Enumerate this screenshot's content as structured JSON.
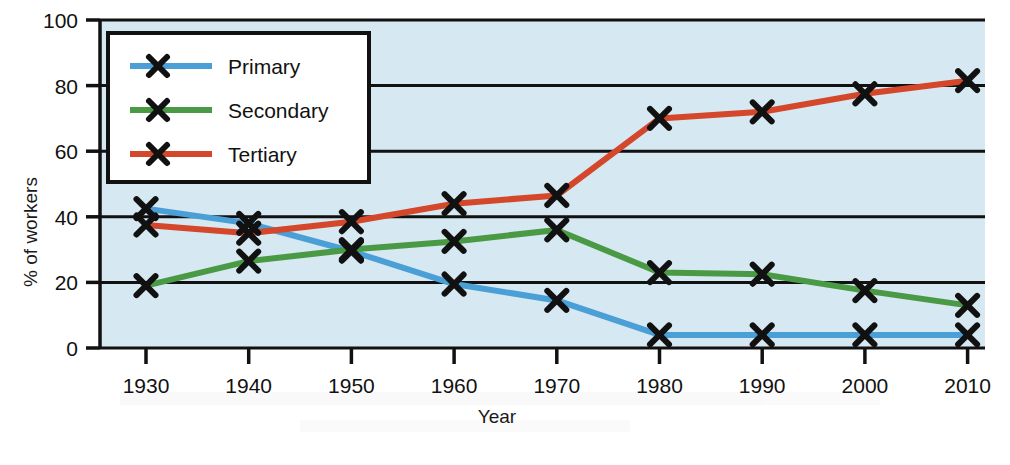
{
  "chart_data": {
    "type": "line",
    "title": "",
    "xlabel": "Year",
    "ylabel": "% of workers",
    "x": [
      1930,
      1940,
      1950,
      1960,
      1970,
      1980,
      1990,
      2000,
      2010
    ],
    "xticklabels": [
      "1930",
      "1940",
      "1950",
      "1960",
      "1970",
      "1980",
      "1990",
      "2000",
      "2010"
    ],
    "yticklabels": [
      "0",
      "20",
      "40",
      "60",
      "80",
      "100"
    ],
    "yticks": [
      0,
      20,
      40,
      60,
      80,
      100
    ],
    "xlim": [
      1925,
      1912
    ],
    "ylim": [
      0,
      100
    ],
    "grid": "horizontal",
    "legend_position": "upper-left-inside",
    "marker": "x",
    "marker_color": "#111111",
    "plot_background": "#d6e8f2",
    "series": [
      {
        "name": "Primary",
        "color": "#4a9fd6",
        "values": [
          42.5,
          38.0,
          29.5,
          19.5,
          14.5,
          4.0,
          4.0,
          4.0,
          4.0
        ]
      },
      {
        "name": "Secondary",
        "color": "#4a9a45",
        "values": [
          19.0,
          26.5,
          30.0,
          32.5,
          36.0,
          23.0,
          22.5,
          17.5,
          13.0
        ]
      },
      {
        "name": "Tertiary",
        "color": "#d4472a",
        "values": [
          37.5,
          35.0,
          38.5,
          44.0,
          46.5,
          70.0,
          72.0,
          77.5,
          81.5
        ]
      }
    ]
  },
  "legend": {
    "items": [
      {
        "label": "Primary"
      },
      {
        "label": "Secondary"
      },
      {
        "label": "Tertiary"
      }
    ]
  },
  "axes": {
    "x_title": "Year",
    "y_title": "% of workers"
  }
}
